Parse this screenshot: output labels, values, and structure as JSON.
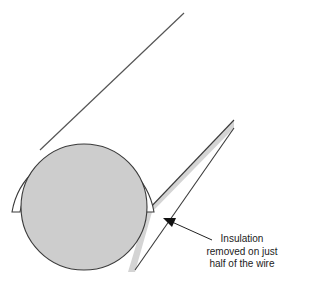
{
  "diagram": {
    "colors": {
      "background": "#ffffff",
      "core_fill": "#cdcdcd",
      "band_fill": "#d4d4d4",
      "insulation_fill": "#ffffff",
      "stroke": "#3a3a3a"
    },
    "label": {
      "lines": [
        "Insulation",
        "removed on just",
        "half of the wire"
      ]
    },
    "elements": [
      {
        "id": "wire-core",
        "shape": "circle",
        "description": "Conductor cross-section (gray)"
      },
      {
        "id": "insulation",
        "shape": "half-ring",
        "description": "Remaining insulation on top half"
      },
      {
        "id": "wire-body",
        "shape": "diagonal cylinder",
        "description": "Wire extending to upper right"
      },
      {
        "id": "exposed-strip",
        "shape": "shaded band",
        "description": "Exposed conductor where insulation removed"
      },
      {
        "id": "callout-arrow",
        "shape": "arrow",
        "description": "Arrow pointing to exposed conductor"
      }
    ]
  }
}
